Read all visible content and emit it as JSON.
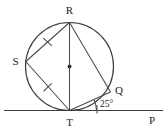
{
  "figure": {
    "kind": "circle-geometry-diagram",
    "background_color": "#ffffff",
    "line_color": "#3a3a3a",
    "label_color": "#242424",
    "circle": {
      "center_x": 69.5,
      "center_y": 66.5,
      "radius": 44.0,
      "center_dot_label": ""
    },
    "points": [
      {
        "id": "R",
        "label": "R",
        "x": 69.5,
        "y": 22.5,
        "label_x": 69.5,
        "label_y": 14.0
      },
      {
        "id": "S",
        "label": "S",
        "x": 25.8,
        "y": 61.5,
        "label_x": 15.5,
        "label_y": 65.0
      },
      {
        "id": "T",
        "label": "T",
        "x": 69.5,
        "y": 110.5,
        "label_x": 69.5,
        "label_y": 126.0
      },
      {
        "id": "Q",
        "label": "Q",
        "x": 110.5,
        "y": 92.0,
        "label_x": 119.0,
        "label_y": 94.0
      },
      {
        "id": "P",
        "label": "P",
        "x": 152.0,
        "y": 110.5,
        "label_x": 152.0,
        "label_y": 124.0
      }
    ],
    "segments": [
      {
        "name": "chord-R-S",
        "from": "R",
        "to": "S",
        "tick_marks": 1
      },
      {
        "name": "chord-S-T",
        "from": "S",
        "to": "T",
        "tick_marks": 1
      },
      {
        "name": "diameter-R-T",
        "from": "R",
        "to": "T",
        "tick_marks": 0
      },
      {
        "name": "chord-R-Q",
        "from": "R",
        "to": "Q",
        "tick_marks": 0
      },
      {
        "name": "chord-T-Q",
        "from": "T",
        "to": "Q",
        "tick_marks": 0
      }
    ],
    "tangent_line": {
      "name": "tangent-at-T",
      "x1": 4.0,
      "y1": 110.5,
      "x2": 163.0,
      "y2": 110.5
    },
    "angles": [
      {
        "name": "angle-Q-T-P",
        "value": "25",
        "unit": "°",
        "label": "25°",
        "label_x": 100.0,
        "label_y": 107.0,
        "vertex": "T"
      }
    ]
  }
}
